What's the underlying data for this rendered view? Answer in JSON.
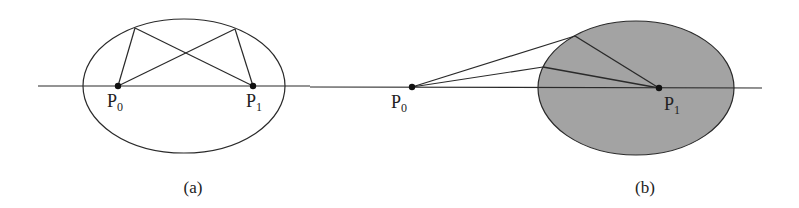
{
  "figure": {
    "panels": [
      {
        "caption": "(a)",
        "points": [
          {
            "name": "P",
            "sub": "0"
          },
          {
            "name": "P",
            "sub": "1"
          }
        ],
        "ellipse_fill": "none"
      },
      {
        "caption": "(b)",
        "points": [
          {
            "name": "P",
            "sub": "0"
          },
          {
            "name": "P",
            "sub": "1"
          }
        ],
        "ellipse_fill": "#a3a3a3"
      }
    ],
    "stroke_color": "#2a2a2a"
  }
}
